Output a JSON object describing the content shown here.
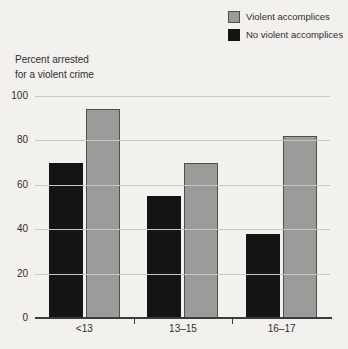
{
  "chart_data": {
    "type": "bar",
    "categories": [
      "<13",
      "13–15",
      "16–17"
    ],
    "series": [
      {
        "name": "No violent accomplices",
        "color": "#141414",
        "border": "#141414",
        "values": [
          70,
          55,
          38
        ]
      },
      {
        "name": "Violent accomplices",
        "color": "#9c9b99",
        "border": "#4f4f4f",
        "values": [
          94,
          70,
          82
        ]
      }
    ],
    "ylabel_lines": [
      "Percent arrested",
      "for a violent crime"
    ],
    "ylabel": "Percent arrested for a violent crime",
    "xlabel": "",
    "title": "",
    "ylim": [
      0,
      100
    ],
    "yticks": [
      0,
      20,
      40,
      60,
      80,
      100
    ],
    "grid": "horizontal",
    "legend_position": "top-right"
  },
  "legend": {
    "items": [
      {
        "label": "Violent accomplices",
        "color": "#9c9b99",
        "border": "#4f4f4f"
      },
      {
        "label": "No violent accomplices",
        "color": "#141414",
        "border": "#141414"
      }
    ]
  },
  "colors": {
    "background": "#f2f1ee",
    "gridline": "#c8c7c3",
    "axis": "#3b3b3b",
    "text": "#2f2f2f"
  }
}
